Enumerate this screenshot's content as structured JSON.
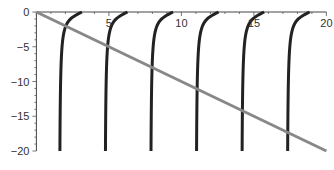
{
  "chart_data": {
    "type": "line",
    "title": "",
    "xlabel": "",
    "ylabel": "",
    "xlim": [
      0,
      20
    ],
    "ylim": [
      -20,
      0
    ],
    "grid": false,
    "legend": "none",
    "x_ticks": [
      5,
      10,
      15,
      20
    ],
    "x_tick_labels": [
      "5",
      "10",
      "15",
      "20"
    ],
    "y_ticks": [
      0,
      -5,
      -10,
      -15,
      -20
    ],
    "y_tick_labels": [
      "0",
      "−5",
      "−10",
      "−15",
      "−20"
    ],
    "series": [
      {
        "name": "y = tan(x)",
        "style": "thick dark curve",
        "color": "#222222",
        "description": "Branches of tan(x) clipped to [-20, 0], each rising from a vertical asymptote at x=(2k+1)π/2 to 0 at x=(k+1)π",
        "asymptotes": [
          1.5708,
          4.7124,
          7.854,
          10.9956,
          14.1372,
          17.2788
        ],
        "zeros": [
          3.1416,
          6.2832,
          9.4248,
          12.5664,
          15.708,
          18.8496
        ]
      },
      {
        "name": "y = -x",
        "style": "thick gray line",
        "color": "#888888",
        "x": [
          0,
          20
        ],
        "y": [
          0,
          -20
        ]
      }
    ]
  },
  "layout": {
    "origin_px": [
      36.4,
      12
    ],
    "x_scale_px": 14.5,
    "y_scale_px": 6.95
  }
}
